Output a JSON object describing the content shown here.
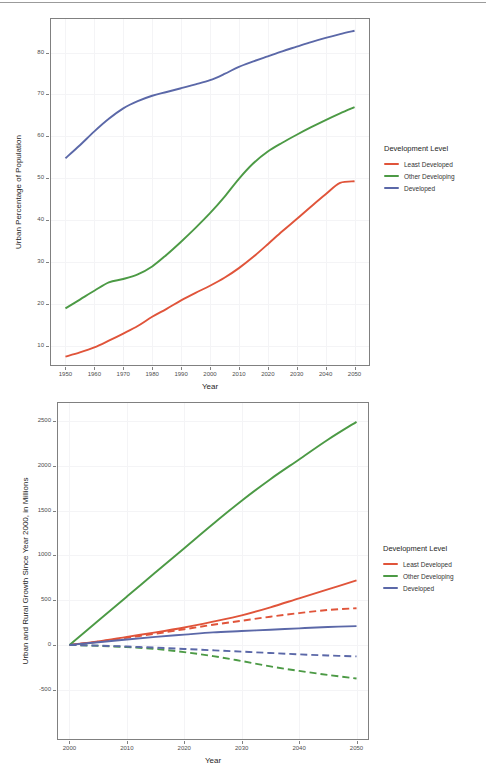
{
  "colors": {
    "least_developed": "#E0543A",
    "other_developing": "#4C9A45",
    "developed": "#5B68A8",
    "panel_border": "#808080",
    "grid": "#F4F4F6",
    "text": "#262626",
    "tick_text": "#4D4D4D"
  },
  "legend": {
    "title": "Development Level",
    "items": [
      {
        "label": "Least Developed",
        "color_key": "least_developed"
      },
      {
        "label": "Other Developing",
        "color_key": "other_developing"
      },
      {
        "label": "Developed",
        "color_key": "developed"
      }
    ]
  },
  "figure_1": {
    "xlabel": "Year",
    "ylabel": "Urban Percentage of Population",
    "xticks": [
      "1950",
      "1960",
      "1970",
      "1980",
      "1990",
      "2000",
      "2010",
      "2020",
      "2030",
      "2040",
      "2050"
    ],
    "yticks": [
      "10",
      "20",
      "30",
      "40",
      "50",
      "60",
      "70",
      "80"
    ]
  },
  "figure_2": {
    "xlabel": "Year",
    "ylabel": "Urban and Rural Growth Since Year 2000, in Millions",
    "xticks": [
      "2000",
      "2010",
      "2020",
      "2030",
      "2040",
      "2050"
    ],
    "yticks": [
      "-500",
      "0",
      "500",
      "1000",
      "1500",
      "2000",
      "2500"
    ]
  },
  "chart_data": [
    {
      "type": "line",
      "title": "",
      "xlabel": "Year",
      "ylabel": "Urban Percentage of Population",
      "x": [
        1950,
        1955,
        1960,
        1965,
        1970,
        1975,
        1980,
        1985,
        1990,
        1995,
        2000,
        2005,
        2010,
        2015,
        2020,
        2025,
        2030,
        2035,
        2040,
        2045,
        2050
      ],
      "xlim": [
        1945,
        2055
      ],
      "ylim": [
        5.5,
        88
      ],
      "xticks": [
        1950,
        1960,
        1970,
        1980,
        1990,
        2000,
        2010,
        2020,
        2030,
        2040,
        2050
      ],
      "yticks": [
        10,
        20,
        30,
        40,
        50,
        60,
        70,
        80
      ],
      "grid": true,
      "legend_position": "right",
      "legend_title": "Development Level",
      "series": [
        {
          "name": "Least Developed",
          "color": "#E0543A",
          "style": "solid",
          "values": [
            7.5,
            8.5,
            9.7,
            11.3,
            13.0,
            14.8,
            17.0,
            18.9,
            20.9,
            22.7,
            24.4,
            26.3,
            28.6,
            31.3,
            34.3,
            37.4,
            40.3,
            43.3,
            46.2,
            48.9,
            49.3
          ]
        },
        {
          "name": "Other Developing",
          "color": "#4C9A45",
          "style": "solid",
          "values": [
            19.0,
            21.1,
            23.2,
            25.2,
            26.0,
            27.1,
            29.0,
            31.8,
            34.9,
            38.2,
            41.7,
            45.6,
            49.9,
            53.6,
            56.4,
            58.5,
            60.4,
            62.2,
            63.9,
            65.5,
            67.0
          ]
        },
        {
          "name": "Developed",
          "color": "#5B68A8",
          "style": "solid",
          "values": [
            54.8,
            57.9,
            61.2,
            64.2,
            66.7,
            68.4,
            69.7,
            70.6,
            71.5,
            72.4,
            73.4,
            74.9,
            76.6,
            77.9,
            79.1,
            80.3,
            81.4,
            82.5,
            83.5,
            84.4,
            85.2
          ]
        }
      ]
    },
    {
      "type": "line",
      "title": "",
      "xlabel": "Year",
      "ylabel": "Urban and Rural Growth Since Year 2000, in Millions",
      "x": [
        2000,
        2005,
        2010,
        2015,
        2020,
        2025,
        2030,
        2035,
        2040,
        2045,
        2050
      ],
      "xlim": [
        1998,
        2052
      ],
      "ylim": [
        -1050,
        2700
      ],
      "xticks": [
        2000,
        2010,
        2020,
        2030,
        2040,
        2050
      ],
      "yticks": [
        -500,
        0,
        500,
        1000,
        1500,
        2000,
        2500
      ],
      "grid": true,
      "legend_position": "right",
      "legend_title": "Development Level",
      "series": [
        {
          "name": "Least Developed (Urban)",
          "color": "#E0543A",
          "style": "solid",
          "values": [
            0,
            40,
            90,
            140,
            195,
            260,
            330,
            420,
            520,
            620,
            720
          ]
        },
        {
          "name": "Least Developed (Rural)",
          "color": "#E0543A",
          "style": "dashed",
          "values": [
            0,
            35,
            80,
            125,
            175,
            225,
            270,
            315,
            355,
            390,
            410
          ]
        },
        {
          "name": "Other Developing (Urban)",
          "color": "#4C9A45",
          "style": "solid",
          "values": [
            0,
            270,
            540,
            810,
            1080,
            1350,
            1610,
            1850,
            2070,
            2290,
            2490
          ]
        },
        {
          "name": "Other Developing (Rural)",
          "color": "#4C9A45",
          "style": "dashed",
          "values": [
            0,
            -10,
            -25,
            -45,
            -80,
            -125,
            -180,
            -240,
            -290,
            -335,
            -375
          ]
        },
        {
          "name": "Developed (Urban)",
          "color": "#5B68A8",
          "style": "solid",
          "values": [
            0,
            30,
            60,
            90,
            115,
            140,
            155,
            170,
            185,
            200,
            210
          ]
        },
        {
          "name": "Developed (Rural)",
          "color": "#5B68A8",
          "style": "dashed",
          "values": [
            0,
            -8,
            -18,
            -30,
            -45,
            -60,
            -75,
            -90,
            -105,
            -118,
            -128
          ]
        }
      ]
    }
  ]
}
